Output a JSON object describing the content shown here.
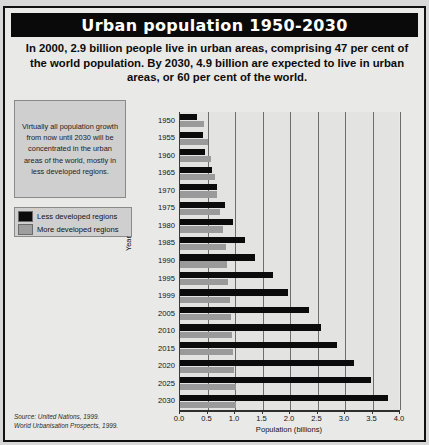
{
  "title": "Urban population 1950-2030",
  "standfirst": "In 2000, 2.9 billion people live in urban areas, comprising 47 per cent of the world population. By 2030, 4.9 billion are expected to live in urban areas, or 60 per cent of the world.",
  "note": "Virtually all population growth from now until 2030 will be concentrated in the urban areas of the world, mostly in less developed regions.",
  "legend": {
    "less_label": "Less developed regions",
    "more_label": "More developed regions",
    "less_color": "#0b0b0b",
    "more_color": "#9a9a9a"
  },
  "source": {
    "line1": "Source: United Nations, 1999.",
    "line2": "World Urbanisation Prospects, 1999."
  },
  "chart_data": {
    "type": "bar",
    "orientation": "horizontal",
    "title": "Urban population 1950-2030",
    "xlabel": "Population (billions)",
    "ylabel": "Year",
    "xlim": [
      0.0,
      4.0
    ],
    "xticks": [
      "0.0",
      "0.5",
      "1.0",
      "1.5",
      "2.0",
      "2.5",
      "3.0",
      "3.5",
      "4.0"
    ],
    "xtick_values": [
      0.0,
      0.5,
      1.0,
      1.5,
      2.0,
      2.5,
      3.0,
      3.5,
      4.0
    ],
    "grid": true,
    "legend_position": "upper-left-outside",
    "categories": [
      "1950",
      "1955",
      "1960",
      "1965",
      "1970",
      "1975",
      "1980",
      "1985",
      "1990",
      "1995",
      "1999",
      "2005",
      "2010",
      "2015",
      "2020",
      "2025",
      "2030"
    ],
    "series": [
      {
        "name": "Less developed regions",
        "color": "#0b0b0b",
        "values": [
          0.31,
          0.41,
          0.46,
          0.58,
          0.68,
          0.81,
          0.97,
          1.18,
          1.37,
          1.69,
          1.97,
          2.34,
          2.56,
          2.86,
          3.16,
          3.47,
          3.78
        ]
      },
      {
        "name": "More developed regions",
        "color": "#9a9a9a",
        "values": [
          0.43,
          0.5,
          0.57,
          0.63,
          0.68,
          0.73,
          0.79,
          0.83,
          0.86,
          0.88,
          0.9,
          0.93,
          0.95,
          0.97,
          0.99,
          1.01,
          1.02
        ]
      }
    ]
  }
}
